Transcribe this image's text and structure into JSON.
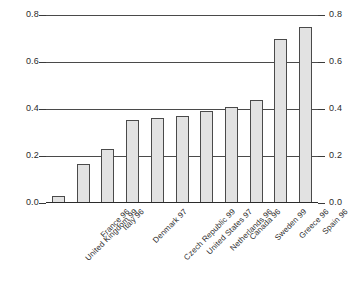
{
  "chart_data": {
    "type": "bar",
    "title": "",
    "subtitle": "",
    "xlabel": "",
    "ylabel": "",
    "categories": [
      "United Kingdom 99",
      "France 96",
      "Italy 96",
      "Denmark 97",
      "Czech Republic 99",
      "United States 97",
      "Netherlands 96",
      "Canada 96",
      "Sweden 99",
      "Greece 96",
      "Spain 96"
    ],
    "values": [
      0.03,
      0.165,
      0.23,
      0.355,
      0.36,
      0.37,
      0.39,
      0.41,
      0.44,
      0.7,
      0.75
    ],
    "ylim": [
      0.0,
      0.8
    ],
    "yticks": [
      "0.0",
      "0.2",
      "0.4",
      "0.6",
      "0.8"
    ],
    "ytick_values": [
      0.0,
      0.2,
      0.4,
      0.6,
      0.8
    ],
    "grid": "horizontal",
    "legend": "none",
    "dual_y_axis": true,
    "right_yticks": [
      "0.0",
      "0.2",
      "0.4",
      "0.6",
      "0.8"
    ],
    "bar_fill_color": "#e2e2e2",
    "bar_border_color": "#4a4a4a",
    "gridline_color": "#4a4a4a",
    "axis_color": "#2b2b2b",
    "background_color": "#ffffff",
    "xtick_label_rotation": -45
  }
}
